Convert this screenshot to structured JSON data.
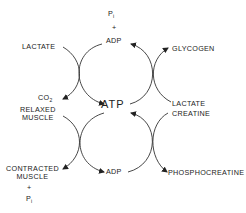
{
  "diagram": {
    "type": "coupled-cycles",
    "center": {
      "atp": "ATP",
      "adp_top": "ADP",
      "adp_bottom": "ADP"
    },
    "top": {
      "pi": "P",
      "pi_sub": "i",
      "plus": "+"
    },
    "left": {
      "lactate": "LACTATE",
      "co2": "CO",
      "co2_sub": "2",
      "relaxed_1": "RELAXED",
      "relaxed_2": "MUSCLE",
      "contracted_1": "CONTRACTED",
      "contracted_2": "MUSCLE",
      "plus": "+",
      "pi": "P",
      "pi_sub": "i"
    },
    "right": {
      "glycogen": "GLYCOGEN",
      "lactate": "LACTATE",
      "creatine": "CREATINE",
      "phosphocreatine": "PHOSPHOCREATINE"
    },
    "colors": {
      "ink": "#222222",
      "background": "#ffffff"
    }
  }
}
